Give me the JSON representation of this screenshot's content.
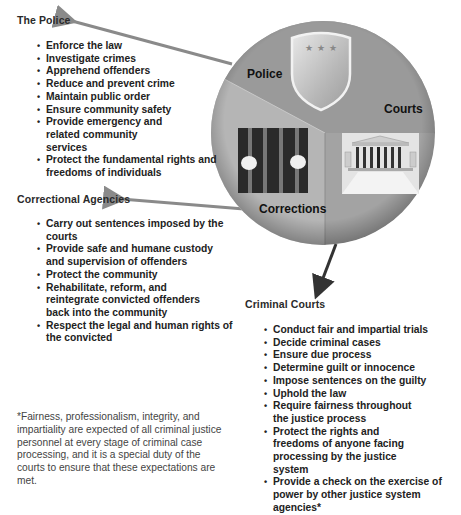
{
  "diagram": {
    "segments": [
      {
        "id": "police",
        "label": "Police",
        "color": "#9a9a9a",
        "icon": "shield-icon"
      },
      {
        "id": "corrections",
        "label": "Corrections",
        "color": "#b5b5b5",
        "icon": "jail-bars-icon"
      },
      {
        "id": "courts",
        "label": "Courts",
        "color": "#a3a3a3",
        "icon": "courthouse-icon"
      }
    ]
  },
  "police": {
    "heading": "The Police",
    "items": [
      "Enforce the law",
      "Investigate crimes",
      "Apprehend offenders",
      "Reduce and prevent crime",
      "Maintain public order",
      "Ensure community safety",
      "Provide emergency and related community services",
      "Protect the fundamental rights and freedoms of individuals"
    ]
  },
  "corrections": {
    "heading": "Correctional Agencies",
    "items": [
      "Carry out sentences imposed by the courts",
      "Provide safe and humane custody and supervision of offenders",
      "Protect the community",
      "Rehabilitate, reform, and reintegrate convicted offenders back into the community",
      "Respect the legal and human rights of the convicted"
    ]
  },
  "courts": {
    "heading": "Criminal Courts",
    "items": [
      "Conduct fair and impartial trials",
      "Decide criminal cases",
      "Ensure due process",
      "Determine guilt or innocence",
      "Impose sentences on the guilty",
      "Uphold the law",
      "Require fairness throughout the justice process",
      "Protect the rights and freedoms of anyone facing processing by the justice system",
      "Provide a check on the exercise of power by other justice system agencies*"
    ]
  },
  "footnote": "*Fairness, professionalism, integrity, and impartiality are expected of all criminal justice personnel at every stage of criminal case processing, and it is a special duty of the courts to ensure that these expectations are met."
}
